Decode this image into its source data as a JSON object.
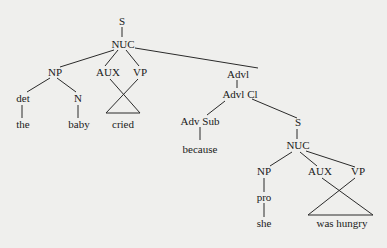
{
  "diagram": {
    "type": "syntax-tree",
    "nodes": {
      "s_root": "S",
      "nuc_main": "NUC",
      "np_main": "NP",
      "aux_main": "AUX",
      "vp_main": "VP",
      "advl": "Advl",
      "det": "det",
      "n": "N",
      "the": "the",
      "baby": "baby",
      "cried": "cried",
      "advl_cl": "Advl Cl",
      "adv_sub": "Adv Sub",
      "because": "because",
      "s_sub": "S",
      "nuc_sub": "NUC",
      "np_sub": "NP",
      "aux_sub": "AUX",
      "vp_sub": "VP",
      "pro": "pro",
      "she": "she",
      "was_hungry": "was hungry"
    },
    "colors": {
      "background": "#efefed",
      "ink": "#1a1a1a"
    }
  }
}
